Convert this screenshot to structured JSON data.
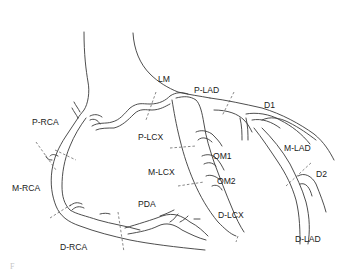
{
  "diagram": {
    "colors": {
      "line": "#3a3a3a",
      "cut": "#555555",
      "text": "#1a1a1a",
      "background": "#ffffff"
    },
    "labels": {
      "lm": "LM",
      "p_lad": "P-LAD",
      "d1": "D1",
      "p_rca": "P-RCA",
      "p_lcx": "P-LCX",
      "om1": "OM1",
      "m_lcx": "M-LCX",
      "om2": "OM2",
      "m_lad": "M-LAD",
      "d2": "D2",
      "m_rca": "M-RCA",
      "pda": "PDA",
      "d_lcx": "D-LCX",
      "d_lad": "D-LAD",
      "d_rca": "D-RCA"
    },
    "caption": "F"
  }
}
